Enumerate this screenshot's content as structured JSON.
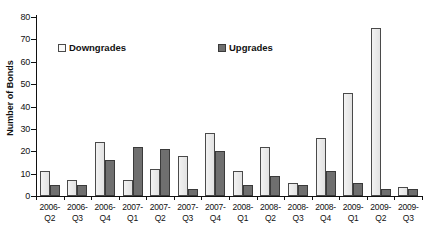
{
  "chart_data": {
    "type": "bar",
    "title": "",
    "xlabel": "",
    "ylabel": "Number of Bonds",
    "ylim": [
      0,
      80
    ],
    "yticks": [
      0,
      10,
      20,
      30,
      40,
      50,
      60,
      70,
      80
    ],
    "grid": false,
    "legend_position": "inside-top-left",
    "categories": [
      "2006-\nQ2",
      "2006-\nQ3",
      "2006-\nQ4",
      "2007-\nQ1",
      "2007-\nQ2",
      "2007-\nQ3",
      "2007-\nQ4",
      "2008-\nQ1",
      "2008-\nQ2",
      "2008-\nQ3",
      "2008-\nQ4",
      "2009-\nQ1",
      "2009-\nQ2",
      "2009-\nQ3"
    ],
    "series": [
      {
        "name": "Downgrades",
        "color": "#efefef",
        "values": [
          11,
          7,
          24,
          7,
          12,
          18,
          28,
          11,
          22,
          6,
          26,
          46,
          75,
          4
        ]
      },
      {
        "name": "Upgrades",
        "color": "#6f6f6f",
        "values": [
          5,
          5,
          16,
          22,
          21,
          3,
          20,
          5,
          9,
          5,
          11,
          6,
          3,
          3
        ]
      }
    ]
  },
  "legend": {
    "downgrades_label": "Downgrades",
    "upgrades_label": "Upgrades"
  },
  "axis": {
    "y_title": "Number of Bonds"
  }
}
